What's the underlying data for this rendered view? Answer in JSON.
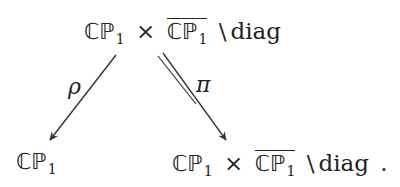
{
  "diagram": {
    "type": "commutative-diagram",
    "nodes": {
      "top": {
        "space": "ℂℙ",
        "sub": "1",
        "times": "×",
        "bar_space": "ℂℙ",
        "bar_sub": "1",
        "setminus": "\\",
        "diag": "diag"
      },
      "bottom_left": {
        "space": "ℂℙ",
        "sub": "1"
      },
      "bottom_right": {
        "space": "ℂℙ",
        "sub": "1",
        "times": "×",
        "bar_space": "ℂℙ",
        "bar_sub": "1",
        "setminus": "\\",
        "diag": "diag",
        "period": "."
      }
    },
    "arrows": [
      {
        "from": "top",
        "to": "bottom_left",
        "label": "ρ",
        "style": "single"
      },
      {
        "from": "top",
        "to": "bottom_right",
        "label": "π",
        "style": "double"
      }
    ],
    "colors": {
      "ink": "#222222",
      "background": "#ffffff"
    }
  }
}
